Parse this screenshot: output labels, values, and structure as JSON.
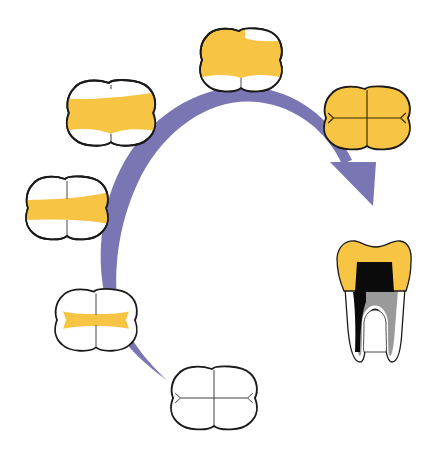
{
  "diagram": {
    "type": "tooth-restoration-progression",
    "colors": {
      "background": "#ffffff",
      "arrow": "#7a76b4",
      "restoration": "#f7c444",
      "outline": "#1a1a1a",
      "tooth": "#ffffff",
      "pulp_dark": "#0b0b0b",
      "pulp_gray": "#9a9a9a"
    },
    "stages": [
      {
        "id": 1,
        "name": "intact-tooth-occlusal",
        "restoration": "none",
        "position": [
          218,
          400
        ]
      },
      {
        "id": 2,
        "name": "small-occlusal-restoration",
        "restoration": "narrow-mesio-distal-strip",
        "position": [
          96,
          320
        ]
      },
      {
        "id": 3,
        "name": "medium-occlusal-restoration",
        "restoration": "wide-mesio-distal-strip",
        "position": [
          67,
          208
        ]
      },
      {
        "id": 4,
        "name": "large-mod-restoration",
        "restoration": "broad-mesio-distal-band",
        "position": [
          111,
          113
        ]
      },
      {
        "id": 5,
        "name": "extensive-restoration",
        "restoration": "near-full-coverage",
        "position": [
          241,
          60
        ]
      },
      {
        "id": 6,
        "name": "full-crown",
        "restoration": "full-coverage-crown",
        "position": [
          367,
          118
        ]
      },
      {
        "id": 7,
        "name": "crown-with-post-core-side-view",
        "restoration": "crown-and-endodontic-treatment",
        "position": [
          376,
          297
        ]
      }
    ],
    "arrow": {
      "direction": "clockwise",
      "start_stage": 1,
      "end_stage": 6,
      "thickness": "tapered-thin-to-thick"
    }
  }
}
